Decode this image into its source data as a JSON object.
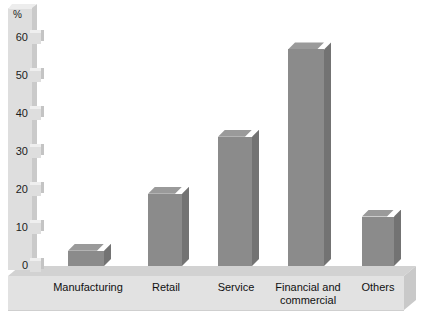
{
  "chart_data": {
    "type": "bar",
    "title": "",
    "subtitle": "",
    "xlabel": "",
    "ylabel": "%",
    "categories": [
      "Manufacturing",
      "Retail",
      "Service",
      "Financial and commercial",
      "Others"
    ],
    "values": [
      4,
      19,
      34,
      57,
      13
    ],
    "ylim": [
      0,
      60
    ],
    "yticks": [
      0,
      10,
      20,
      30,
      40,
      50,
      60
    ],
    "ytick_labels": [
      "0",
      "10",
      "20",
      "30",
      "40",
      "50",
      "60"
    ],
    "grid": false,
    "legend": null,
    "style": "3d-bar",
    "colors": {
      "bar_front": "#8b8b8b",
      "bar_top": "#9a9a9a",
      "bar_side": "#737373",
      "axis_column": "#dedede",
      "floor_front": "#e2e2e2",
      "floor_top": "#d2d2d2",
      "text": "#1c1c1c",
      "background": "#ffffff"
    }
  },
  "axis": {
    "unit_label": "%",
    "ticks": [
      {
        "label": "60",
        "value": 60
      },
      {
        "label": "50",
        "value": 50
      },
      {
        "label": "40",
        "value": 40
      },
      {
        "label": "30",
        "value": 30
      },
      {
        "label": "20",
        "value": 20
      },
      {
        "label": "10",
        "value": 10
      },
      {
        "label": "0",
        "value": 0
      }
    ]
  },
  "bars": [
    {
      "label": "Manufacturing",
      "label_line1": "Manufacturing",
      "label_line2": "",
      "value": 4
    },
    {
      "label": "Retail",
      "label_line1": "Retail",
      "label_line2": "",
      "value": 19
    },
    {
      "label": "Service",
      "label_line1": "Service",
      "label_line2": "",
      "value": 34
    },
    {
      "label": "Financial and commercial",
      "label_line1": "Financial and",
      "label_line2": "commercial",
      "value": 57
    },
    {
      "label": "Others",
      "label_line1": "Others",
      "label_line2": "",
      "value": 13
    }
  ]
}
